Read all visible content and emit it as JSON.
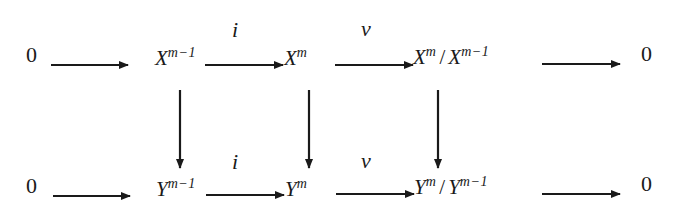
{
  "diagram": {
    "type": "commutative-diagram",
    "rows": {
      "top": {
        "zero_left": "0",
        "left_base": "X",
        "left_exp": "m−1",
        "mid_base": "X",
        "mid_exp": "m",
        "quot_num_base": "X",
        "quot_num_exp": "m",
        "quot_slash": "/",
        "quot_den_base": "X",
        "quot_den_exp": "m−1",
        "zero_right": "0"
      },
      "bottom": {
        "zero_left": "0",
        "left_base": "Y",
        "left_exp": "m−1",
        "mid_base": "Y",
        "mid_exp": "m",
        "quot_num_base": "Y",
        "quot_num_exp": "m",
        "quot_slash": "/",
        "quot_den_base": "Y",
        "quot_den_exp": "m−1",
        "zero_right": "0"
      }
    },
    "labels": {
      "top_inclusion": "i",
      "top_projection": "ν",
      "bottom_inclusion": "i",
      "bottom_projection": "ν"
    },
    "colors": {
      "ink": "#1a1a1a",
      "background": "#ffffff"
    }
  }
}
